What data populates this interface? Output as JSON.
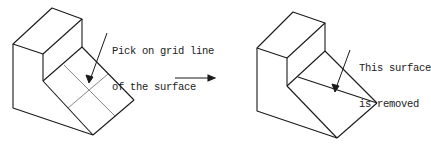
{
  "diagram": {
    "type": "cad-procedure-illustration",
    "before": {
      "callout": [
        "Pick on grid line",
        "of the surface"
      ],
      "description": "Isometric stepped block with a sloped surface divided by a 2x2 grid; arrow points to grid line intersection"
    },
    "transition": {
      "icon": "right-arrow-icon"
    },
    "after": {
      "callout": [
        "This surface",
        "is removed"
      ],
      "description": "Same block with the sloped surface removed, showing a diagonal edge; arrow points to the removed face"
    },
    "colors": {
      "line": "#1a1a1a",
      "grid": "#555555",
      "text": "#222222",
      "background": "#ffffff"
    }
  }
}
